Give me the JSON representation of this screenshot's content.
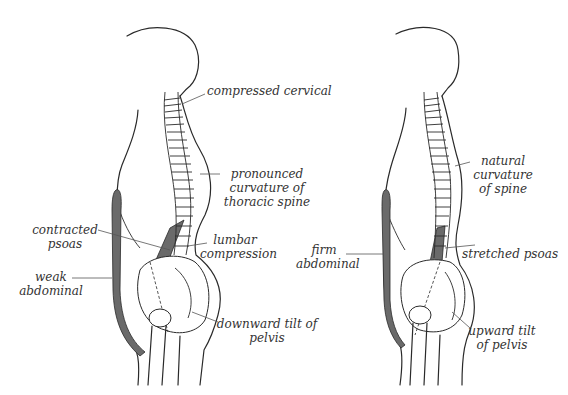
{
  "diagram": {
    "type": "anatomical-comparison",
    "figures": [
      {
        "id": "poor-posture",
        "labels": {
          "compressed_cervical": "compressed cervical",
          "thoracic_1": "pronounced",
          "thoracic_2": "curvature of",
          "thoracic_3": "thoracic spine",
          "psoas_1": "contracted",
          "psoas_2": "psoas",
          "abdominal_1": "weak",
          "abdominal_2": "abdominal",
          "lumbar_1": "lumbar",
          "lumbar_2": "compression",
          "pelvis_1": "downward tilt of",
          "pelvis_2": "pelvis"
        }
      },
      {
        "id": "good-posture",
        "labels": {
          "spine_1": "natural",
          "spine_2": "curvature",
          "spine_3": "of spine",
          "abdominal_1": "firm",
          "abdominal_2": "abdominal",
          "psoas": "stretched psoas",
          "pelvis_1": "upward tilt",
          "pelvis_2": "of pelvis"
        }
      }
    ],
    "colors": {
      "line": "#2a2a2a",
      "muscle": "#6a6a6a",
      "text": "#333333",
      "background": "#ffffff"
    }
  }
}
